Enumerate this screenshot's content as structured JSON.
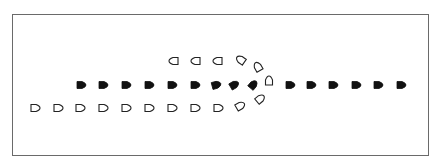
{
  "diagram": {
    "title": "",
    "colors": {
      "border": "#6a6a6a",
      "filled": "#111111",
      "hollow_stroke": "#222222",
      "background": "#ffffff"
    },
    "markers": [
      {
        "x": 174,
        "y": 61,
        "angle": 180,
        "style": "hollow"
      },
      {
        "x": 196,
        "y": 61,
        "angle": 180,
        "style": "hollow"
      },
      {
        "x": 218,
        "y": 61,
        "angle": 180,
        "style": "hollow"
      },
      {
        "x": 241,
        "y": 60,
        "angle": 215,
        "style": "hollow"
      },
      {
        "x": 258,
        "y": 67,
        "angle": 240,
        "style": "hollow"
      },
      {
        "x": 81,
        "y": 85,
        "angle": 0,
        "style": "filled"
      },
      {
        "x": 103,
        "y": 85,
        "angle": 0,
        "style": "filled"
      },
      {
        "x": 126,
        "y": 85,
        "angle": 0,
        "style": "filled"
      },
      {
        "x": 149,
        "y": 85,
        "angle": 0,
        "style": "filled"
      },
      {
        "x": 172,
        "y": 85,
        "angle": 0,
        "style": "filled"
      },
      {
        "x": 195,
        "y": 85,
        "angle": 0,
        "style": "filled"
      },
      {
        "x": 216,
        "y": 85,
        "angle": -15,
        "style": "filled"
      },
      {
        "x": 234,
        "y": 85,
        "angle": -30,
        "style": "filled"
      },
      {
        "x": 253,
        "y": 85,
        "angle": -50,
        "style": "filled"
      },
      {
        "x": 269,
        "y": 81,
        "angle": -90,
        "style": "hollow"
      },
      {
        "x": 290,
        "y": 85,
        "angle": 0,
        "style": "filled"
      },
      {
        "x": 311,
        "y": 85,
        "angle": 0,
        "style": "filled"
      },
      {
        "x": 333,
        "y": 85,
        "angle": 0,
        "style": "filled"
      },
      {
        "x": 356,
        "y": 85,
        "angle": 0,
        "style": "filled"
      },
      {
        "x": 378,
        "y": 85,
        "angle": 0,
        "style": "filled"
      },
      {
        "x": 401,
        "y": 85,
        "angle": 0,
        "style": "filled"
      },
      {
        "x": 35,
        "y": 108,
        "angle": 0,
        "style": "hollow"
      },
      {
        "x": 58,
        "y": 108,
        "angle": 0,
        "style": "hollow"
      },
      {
        "x": 80,
        "y": 108,
        "angle": 0,
        "style": "hollow"
      },
      {
        "x": 103,
        "y": 108,
        "angle": 0,
        "style": "hollow"
      },
      {
        "x": 126,
        "y": 108,
        "angle": 0,
        "style": "hollow"
      },
      {
        "x": 149,
        "y": 108,
        "angle": 0,
        "style": "hollow"
      },
      {
        "x": 172,
        "y": 108,
        "angle": 0,
        "style": "hollow"
      },
      {
        "x": 195,
        "y": 108,
        "angle": 0,
        "style": "hollow"
      },
      {
        "x": 218,
        "y": 108,
        "angle": 0,
        "style": "hollow"
      },
      {
        "x": 240,
        "y": 106,
        "angle": -30,
        "style": "hollow"
      },
      {
        "x": 260,
        "y": 99,
        "angle": -40,
        "style": "hollow"
      }
    ]
  }
}
